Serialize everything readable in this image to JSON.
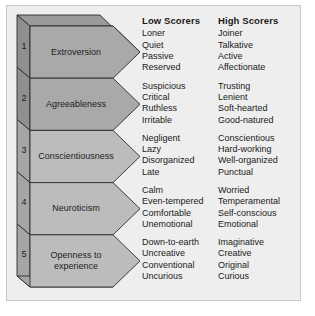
{
  "figure": {
    "title_low": "Low Scorers",
    "title_high": "High Scorers",
    "panel_bg": "#efeeee",
    "panel_border": "#c9c8c8",
    "block_fill_dark": "#a9a9a9",
    "block_fill_light": "#bdbcbc",
    "side_fill_dark": "#8f8f8f",
    "side_fill_light": "#a6a5a5",
    "top_fill": "#9a9a9a",
    "stroke": "#2b2b2b",
    "rows": [
      {
        "number": "1",
        "trait": "Extroversion",
        "shade": "dark",
        "low": [
          "Loner",
          "Quiet",
          "Passive",
          "Reserved"
        ],
        "high": [
          "Joiner",
          "Talkative",
          "Active",
          "Affectionate"
        ]
      },
      {
        "number": "2",
        "trait": "Agreeableness",
        "shade": "dark",
        "low": [
          "Suspicious",
          "Critical",
          "Ruthless",
          "Irritable"
        ],
        "high": [
          "Trusting",
          "Lenient",
          "Soft-hearted",
          "Good-natured"
        ]
      },
      {
        "number": "3",
        "trait": "Conscientiousness",
        "shade": "light",
        "low": [
          "Negligent",
          "Lazy",
          "Disorganized",
          "Late"
        ],
        "high": [
          "Conscientious",
          "Hard-working",
          "Well-organized",
          "Punctual"
        ]
      },
      {
        "number": "4",
        "trait": "Neuroticism",
        "shade": "light",
        "low": [
          "Calm",
          "Even-tempered",
          "Comfortable",
          "Unemotional"
        ],
        "high": [
          "Worried",
          "Temperamental",
          "Self-conscious",
          "Emotional"
        ]
      },
      {
        "number": "5",
        "trait": "Openness to\nexperience",
        "shade": "light",
        "low": [
          "Down-to-earth",
          "Uncreative",
          "Conventional",
          "Uncurious"
        ],
        "high": [
          "Imaginative",
          "Creative",
          "Original",
          "Curious"
        ]
      }
    ]
  }
}
